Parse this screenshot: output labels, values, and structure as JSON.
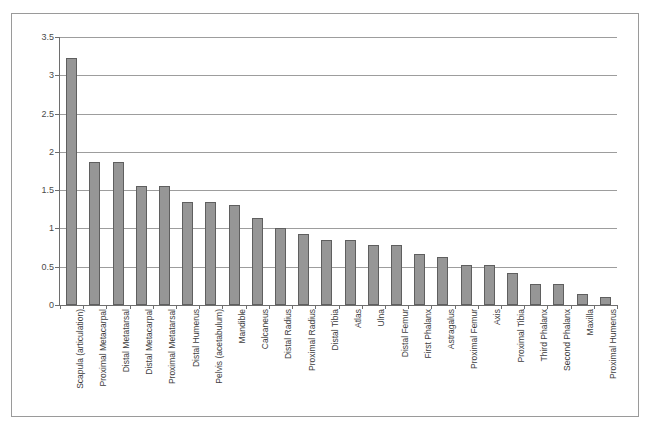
{
  "chart_data": {
    "type": "bar",
    "title": "",
    "subtitle": "",
    "xlabel": "",
    "ylabel": "",
    "ylim": [
      0,
      3.5
    ],
    "ytick_labels": [
      "3.5",
      "3",
      "2.5",
      "2",
      "1.5",
      "1",
      "0.5",
      "0"
    ],
    "yticks": [
      3.5,
      3,
      2.5,
      2,
      1.5,
      1,
      0.5,
      0
    ],
    "grid": true,
    "legend": null,
    "legend_position": "none",
    "orientation": "vertical",
    "bar_color": "#969696",
    "bar_border_color": "#5f5f5f",
    "gridline_color": "#9d9d9d",
    "axis_color": "#6e6e6e",
    "frame_color": "#9a9a9a",
    "background": "#ffffff",
    "label_rotation": -90,
    "categories": [
      "Scapula (articulation)",
      "Proximal Metacarpal",
      "Distal Metatarsal",
      "Distal Metacarpal",
      "Proximal Metatarsal",
      "Distal Humerus",
      "Pelvis (acetabulum)",
      "Mandible",
      "Calcaneus",
      "Distal Radius",
      "Proximal Radius",
      "Distal Tibia",
      "Atlas",
      "Ulna",
      "Distal Femur",
      "First Phalanx",
      "Astragalus",
      "Proximal Femur",
      "Axis",
      "Proximal Tibia",
      "Third Phalanx",
      "Second Phalanx",
      "Maxilla",
      "Proximal Humerus"
    ],
    "values": [
      3.22,
      1.87,
      1.87,
      1.56,
      1.56,
      1.35,
      1.35,
      1.3,
      1.14,
      1.0,
      0.93,
      0.85,
      0.85,
      0.78,
      0.78,
      0.67,
      0.63,
      0.52,
      0.52,
      0.42,
      0.28,
      0.28,
      0.15,
      0.1
    ]
  }
}
